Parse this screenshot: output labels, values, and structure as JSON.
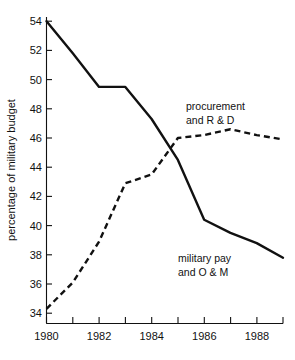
{
  "chart_data": {
    "type": "line",
    "title": "",
    "subtitle": "",
    "xlabel": "",
    "ylabel": "percentage of military budget",
    "x": [
      1980,
      1981,
      1982,
      1983,
      1984,
      1985,
      1986,
      1987,
      1988,
      1989
    ],
    "xlim": [
      1980,
      1989
    ],
    "ylim": [
      33.2,
      54.6
    ],
    "grid": false,
    "legend_position": "inline-annotations",
    "x_tick_values": [
      1980,
      1981,
      1982,
      1983,
      1984,
      1985,
      1986,
      1987,
      1988,
      1989
    ],
    "x_tick_labels": [
      "1980",
      "",
      "1982",
      "",
      "1984",
      "",
      "1986",
      "",
      "1988",
      ""
    ],
    "y_tick_values": [
      34,
      36,
      38,
      40,
      42,
      44,
      46,
      48,
      50,
      52,
      54
    ],
    "y_tick_labels": [
      "34",
      "36",
      "38",
      "40",
      "42",
      "44",
      "46",
      "48",
      "50",
      "52",
      "54"
    ],
    "series": [
      {
        "name": "military pay and O & M",
        "label_line1": "military pay",
        "label_line2": "and O & M",
        "style": "solid",
        "color": "#111111",
        "values": [
          54.0,
          51.8,
          49.5,
          49.5,
          47.3,
          44.5,
          40.4,
          39.5,
          38.8,
          37.8
        ]
      },
      {
        "name": "procurement and R & D",
        "label_line1": "procurement",
        "label_line2": "and R & D",
        "style": "dashed",
        "color": "#111111",
        "values": [
          34.3,
          36.1,
          38.9,
          42.9,
          43.5,
          46.0,
          46.2,
          46.6,
          46.2,
          45.9
        ]
      }
    ]
  },
  "axis": {
    "y_title": "percentage of military budget"
  },
  "annotations": {
    "procurement_line1": "procurement",
    "procurement_line2": "and R & D",
    "military_pay_line1": "military pay",
    "military_pay_line2": "and O & M"
  },
  "ticks": {
    "y": [
      "54",
      "52",
      "50",
      "48",
      "46",
      "44",
      "42",
      "40",
      "38",
      "36",
      "34"
    ],
    "x": [
      "1980",
      "1982",
      "1984",
      "1986",
      "1988"
    ]
  }
}
